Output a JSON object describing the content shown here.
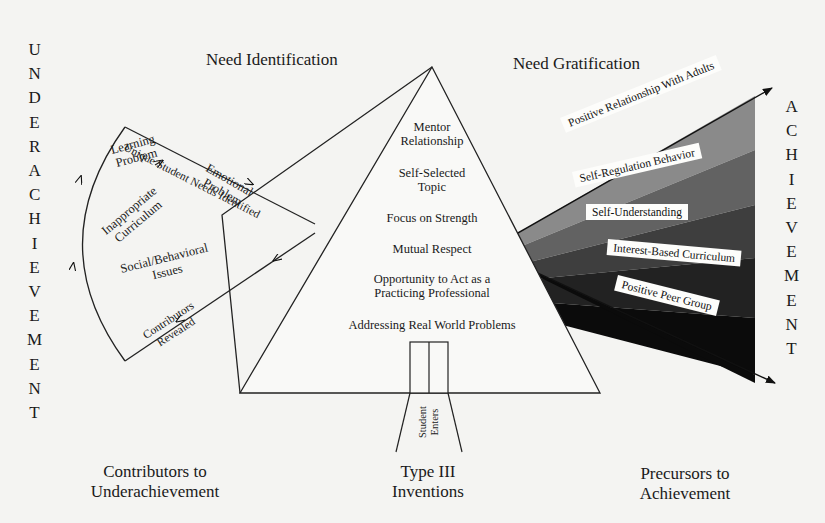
{
  "diagram": {
    "left_vertical_word": [
      "U",
      "N",
      "D",
      "E",
      "R",
      "A",
      "C",
      "H",
      "I",
      "E",
      "V",
      "E",
      "M",
      "E",
      "N",
      "T"
    ],
    "right_vertical_word": [
      "A",
      "C",
      "H",
      "I",
      "E",
      "V",
      "E",
      "M",
      "E",
      "N",
      "T"
    ],
    "headings": {
      "need_identification": "Need Identification",
      "need_gratification": "Need Gratification"
    },
    "left_fan": {
      "path_label_top": "Unique Student Needs Identified",
      "path_label_bottom_line1": "Contributors",
      "path_label_bottom_line2": "Revealed",
      "items": [
        {
          "line1": "Learning",
          "line2": "Problem"
        },
        {
          "line1": "Emotional",
          "line2": "Problem"
        },
        {
          "line1": "Inappropriate",
          "line2": "Curriculum"
        },
        {
          "line1": "Social/Behavioral",
          "line2": "Issues"
        }
      ]
    },
    "pyramid": {
      "items": [
        {
          "line1": "Mentor",
          "line2": "Relationship"
        },
        {
          "line1": "Self-Selected",
          "line2": "Topic"
        },
        {
          "line1": "Focus on Strength",
          "line2": ""
        },
        {
          "line1": "Mutual Respect",
          "line2": ""
        },
        {
          "line1": "Opportunity to Act as a",
          "line2": "Practicing Professional"
        },
        {
          "line1": "Addressing Real World Problems",
          "line2": ""
        }
      ],
      "door_label_line1": "Student",
      "door_label_line2": "Enters"
    },
    "right_bands": {
      "colors": [
        "#8a8a8a",
        "#5e5e5e",
        "#3a3a3a",
        "#1e1e1e",
        "#0a0a0a"
      ],
      "items": [
        "Positive Relationship With Adults",
        "Self-Regulation Behavior",
        "Self-Understanding",
        "Interest-Based Curriculum",
        "Positive Peer Group"
      ]
    },
    "captions": {
      "left_line1": "Contributors to",
      "left_line2": "Underachievement",
      "center_line1": "Type III",
      "center_line2": "Inventions",
      "right_line1": "Precursors to",
      "right_line2": "Achievement"
    }
  }
}
